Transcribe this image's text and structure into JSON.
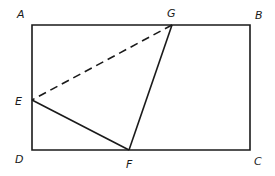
{
  "diagram": {
    "type": "geometry",
    "stroke_color": "#1a1a1a",
    "background": "#ffffff",
    "points": {
      "A": {
        "label": "A",
        "x": 32,
        "y": 25,
        "label_x": 17,
        "label_y": 18
      },
      "B": {
        "label": "B",
        "x": 250,
        "y": 25,
        "label_x": 255,
        "label_y": 19
      },
      "C": {
        "label": "C",
        "x": 250,
        "y": 150,
        "label_x": 254,
        "label_y": 165
      },
      "D": {
        "label": "D",
        "x": 32,
        "y": 150,
        "label_x": 15,
        "label_y": 163
      },
      "E": {
        "label": "E",
        "x": 32,
        "y": 100,
        "label_x": 15,
        "label_y": 105
      },
      "F": {
        "label": "F",
        "x": 129,
        "y": 150,
        "label_x": 126,
        "label_y": 168
      },
      "G": {
        "label": "G",
        "x": 172,
        "y": 25,
        "label_x": 167,
        "label_y": 17
      }
    },
    "segments": [
      {
        "from": "A",
        "to": "B",
        "style": "solid"
      },
      {
        "from": "B",
        "to": "C",
        "style": "solid"
      },
      {
        "from": "C",
        "to": "D",
        "style": "solid"
      },
      {
        "from": "D",
        "to": "A",
        "style": "solid"
      },
      {
        "from": "E",
        "to": "F",
        "style": "solid"
      },
      {
        "from": "F",
        "to": "G",
        "style": "solid"
      },
      {
        "from": "G",
        "to": "E",
        "style": "dashed"
      }
    ]
  }
}
